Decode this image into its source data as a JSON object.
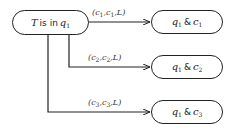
{
  "diagram": {
    "type": "state-transition",
    "source_node": {
      "var": "T",
      "text": "is in",
      "state": "q",
      "state_sub": "1"
    },
    "targets": [
      {
        "q": "q",
        "q_sub": "1",
        "amp": "&",
        "c": "c",
        "c_sub": "1",
        "edge": {
          "open": "(",
          "a": "c",
          "a_sub": "1",
          "b": "c",
          "b_sub": "1",
          "dir": ",L)"
        }
      },
      {
        "q": "q",
        "q_sub": "1",
        "amp": "&",
        "c": "c",
        "c_sub": "2",
        "edge": {
          "open": "(",
          "a": "c",
          "a_sub": "2",
          "b": "c",
          "b_sub": "2",
          "dir": ",L)"
        }
      },
      {
        "q": "q",
        "q_sub": "1",
        "amp": "&",
        "c": "c",
        "c_sub": "3",
        "edge": {
          "open": "(",
          "a": "c",
          "a_sub": "3",
          "b": "c",
          "b_sub": "3",
          "dir": ",L)"
        }
      }
    ],
    "colors": {
      "stroke": "#222222",
      "background": "#ffffff"
    }
  }
}
